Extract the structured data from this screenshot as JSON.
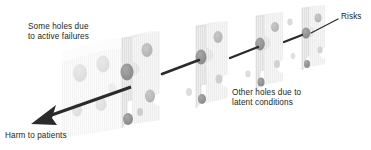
{
  "diagram": {
    "background_color": "#ffffff",
    "text_color": "#231f20"
  },
  "labels": {
    "active_failures_line1": "Some holes due",
    "active_failures_line2": "to active failures",
    "latent_conditions_line1": "Other holes due to",
    "latent_conditions_line2": "latent conditions",
    "risks": "Risks",
    "harm": "Harm to patients"
  },
  "colors": {
    "slice_face": "#ececec",
    "slice_stripe": "#dcdcdc",
    "slice_edge": "#c9c9c9",
    "slice_top": "#f4f4f4",
    "hole_dark": "#8d8d8d",
    "hole_mid": "#a6a6a6",
    "hole_light": "#c4c4c4",
    "ghost_face": "#f7f7f7",
    "ghost_hole": "#d8d8d8",
    "arrow": "#2b2b2b",
    "leader": "#2b2b2b"
  },
  "slices": [
    {
      "name": "ghost-slice",
      "opacity": 0.35,
      "front_x": 62,
      "top_y": 48,
      "height": 86,
      "width": 60
    },
    {
      "name": "slice-1",
      "opacity": 1.0,
      "front_x": 122,
      "top_y": 38,
      "height": 90,
      "width": 38
    },
    {
      "name": "slice-2",
      "opacity": 1.0,
      "front_x": 196,
      "top_y": 26,
      "height": 80,
      "width": 32
    },
    {
      "name": "slice-3",
      "opacity": 1.0,
      "front_x": 256,
      "top_y": 16,
      "height": 70,
      "width": 27
    },
    {
      "name": "slice-4",
      "opacity": 1.0,
      "front_x": 302,
      "top_y": 8,
      "height": 62,
      "width": 23
    }
  ],
  "arrows": {
    "main_trajectory": "from slice-1 hole down-left to harm",
    "segments": 4
  }
}
